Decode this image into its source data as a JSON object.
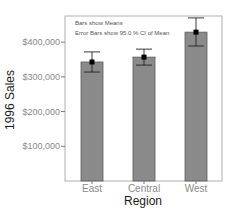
{
  "chart_data": {
    "type": "bar",
    "title": "",
    "annotations": [
      "Bars show Means",
      "Error Bars show 95.0 % CI of Mean"
    ],
    "xlabel": "Region",
    "ylabel": "1996 Sales",
    "categories": [
      "East",
      "Central",
      "West"
    ],
    "values": [
      343000,
      357000,
      429000
    ],
    "error_bars": {
      "type": "95% CI",
      "lower": [
        314000,
        334000,
        389000
      ],
      "upper": [
        372000,
        380000,
        470000
      ]
    },
    "ylim": [
      0,
      470000
    ],
    "yticks": [
      100000,
      200000,
      300000,
      400000
    ],
    "ytick_labels": [
      "$100,000",
      "$200,000",
      "$300,000",
      "$400,000"
    ],
    "grid": false,
    "legend": "none",
    "colors": {
      "bar_fill": "#8a8a8a",
      "bar_stroke": "#5a5a5a",
      "frame": "#b0b0b0",
      "error_bar": "#222222",
      "mean_marker": "#000000"
    }
  }
}
